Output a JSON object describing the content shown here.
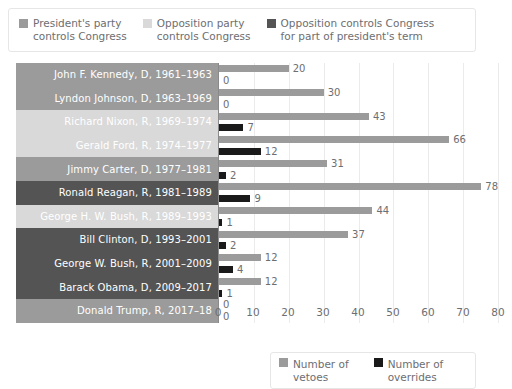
{
  "colors": {
    "president_party": "#9b9b9b",
    "opposition_party": "#d9d9d9",
    "opposition_part_term": "#545454",
    "veto_bar": "#9b9b9b",
    "override_bar": "#1a1a1a",
    "label_text": "#ffffff",
    "axis_text": "#6d6e71",
    "gridline": "#ebebeb",
    "card_border": "#e6e6e6",
    "background": "#ffffff"
  },
  "top_legend": {
    "items": [
      {
        "label": "President's party\ncontrols Congress",
        "swatch_color": "#9b9b9b",
        "icon": "square-swatch-icon"
      },
      {
        "label": "Opposition party\ncontrols Congress",
        "swatch_color": "#d9d9d9",
        "icon": "square-swatch-icon"
      },
      {
        "label": "Opposition controls Congress\nfor part of president's term",
        "swatch_color": "#545454",
        "icon": "square-swatch-icon"
      }
    ]
  },
  "bottom_legend": {
    "items": [
      {
        "label": "Number of vetoes",
        "swatch_color": "#9b9b9b",
        "icon": "square-swatch-icon"
      },
      {
        "label": "Number of overrides",
        "swatch_color": "#1a1a1a",
        "icon": "square-swatch-icon"
      }
    ]
  },
  "chart_data": {
    "type": "bar",
    "orientation": "horizontal",
    "title": "",
    "xlabel": "",
    "ylabel": "",
    "xlim": [
      0,
      80
    ],
    "xticks": [
      0,
      10,
      20,
      30,
      40,
      50,
      60,
      70,
      80
    ],
    "grid": true,
    "legend_position": "top-left and bottom-right",
    "categories": [
      "John F. Kennedy, D, 1961–1963",
      "Lyndon Johnson, D, 1963–1969",
      "Richard Nixon, R, 1969–1974",
      "Gerald Ford, R, 1974–1977",
      "Jimmy Carter, D, 1977–1981",
      "Ronald Reagan, R, 1981–1989",
      "George H. W. Bush, R, 1989–1993",
      "Bill Clinton, D, 1993–2001",
      "George W. Bush, R, 2001–2009",
      "Barack Obama, D, 2009–2017",
      "Donald Trump, R, 2017–18"
    ],
    "series": [
      {
        "name": "Number of vetoes",
        "values": [
          20,
          30,
          43,
          66,
          31,
          78,
          44,
          37,
          12,
          12,
          0
        ]
      },
      {
        "name": "Number of overrides",
        "values": [
          0,
          0,
          7,
          12,
          2,
          9,
          1,
          2,
          4,
          1,
          0
        ]
      }
    ],
    "congress_control": [
      "president_party",
      "president_party",
      "opposition_party",
      "opposition_party",
      "president_party",
      "opposition_part_term",
      "opposition_party",
      "opposition_part_term",
      "opposition_part_term",
      "opposition_part_term",
      "president_party"
    ]
  }
}
